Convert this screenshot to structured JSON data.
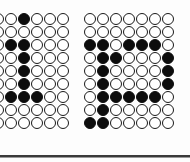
{
  "figure": {
    "colors": {
      "filled": "#0d0d0d",
      "empty": "#ffffff",
      "outline": "#1a1a1a",
      "rule": "#3a3a3a"
    },
    "grids": [
      {
        "name": "left",
        "rows": 9,
        "cols": 6,
        "filled": [
          [
            0,
            2
          ],
          [
            2,
            1
          ],
          [
            2,
            2
          ],
          [
            3,
            2
          ],
          [
            4,
            2
          ],
          [
            5,
            2
          ],
          [
            6,
            1
          ],
          [
            6,
            2
          ],
          [
            6,
            3
          ]
        ]
      },
      {
        "name": "right",
        "rows": 9,
        "cols": 7,
        "filled": [
          [
            2,
            0
          ],
          [
            2,
            1
          ],
          [
            2,
            3
          ],
          [
            2,
            4
          ],
          [
            2,
            5
          ],
          [
            3,
            1
          ],
          [
            3,
            2
          ],
          [
            3,
            6
          ],
          [
            4,
            1
          ],
          [
            4,
            6
          ],
          [
            5,
            1
          ],
          [
            5,
            6
          ],
          [
            6,
            1
          ],
          [
            6,
            2
          ],
          [
            6,
            3
          ],
          [
            6,
            4
          ],
          [
            6,
            5
          ],
          [
            7,
            1
          ],
          [
            8,
            0
          ],
          [
            8,
            1
          ]
        ]
      }
    ]
  }
}
